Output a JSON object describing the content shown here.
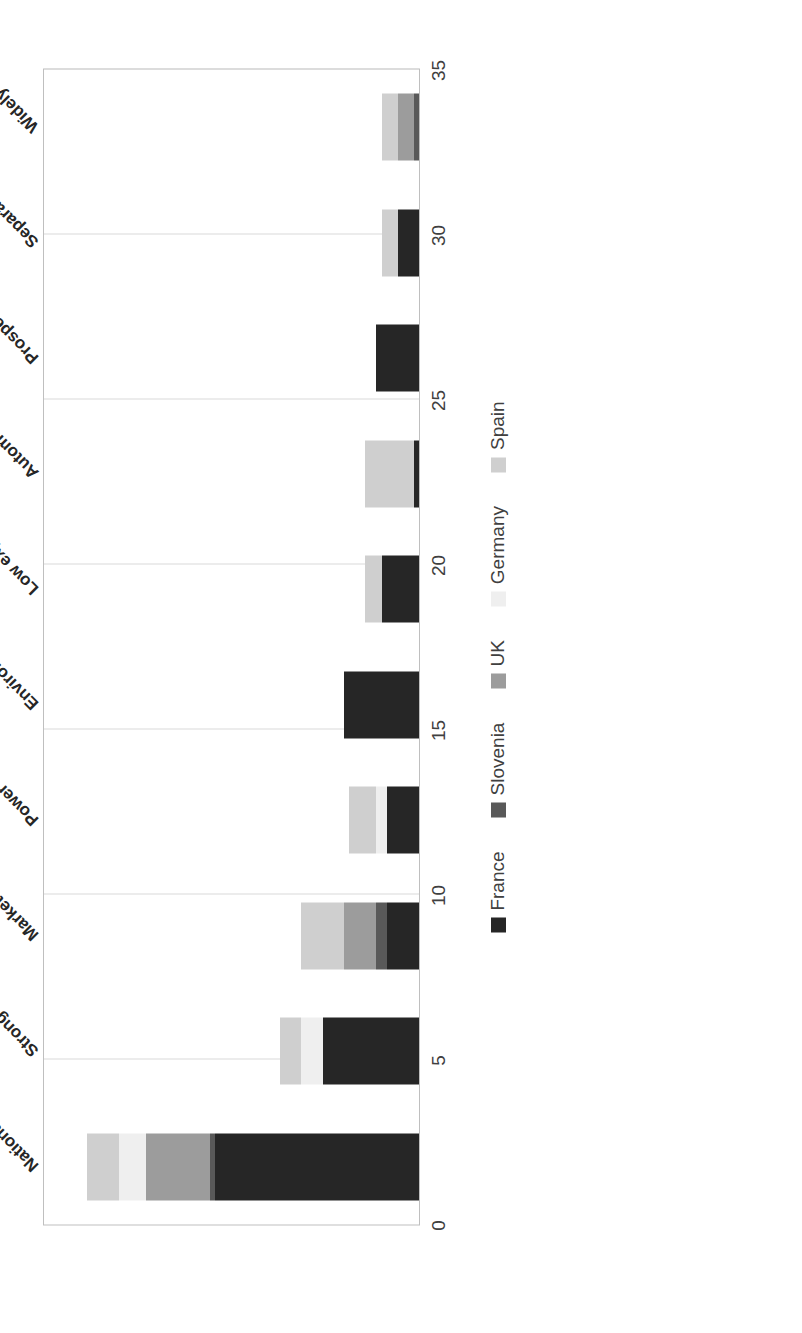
{
  "chart_data": {
    "type": "bar",
    "title": "",
    "subtitle": "",
    "xlabel": "",
    "ylabel": "",
    "orientation": "vertical-stacked",
    "stacked": true,
    "grid": true,
    "legend_position": "bottom",
    "ylim": [
      0,
      35
    ],
    "yticks": [
      0,
      5,
      10,
      15,
      20,
      25,
      30,
      35
    ],
    "ytick_labels": [
      "0",
      "5",
      "10",
      "15",
      "20",
      "25",
      "30",
      "35"
    ],
    "categories": [
      "National differences and specificities",
      "Strong potential but uncertain future",
      "Market development in near term",
      "Power to gas",
      "Environmental goals will drive H2 use",
      "Low expectations in short term",
      "Automobile use critical to FC future",
      "Prospects for stationary and mobile are related",
      "Separate coexistence with batteries",
      "Widely prevalent in long term"
    ],
    "series": [
      {
        "name": "France",
        "color": "#262626",
        "values": [
          19,
          9,
          3,
          3,
          7,
          3.5,
          0.5,
          4,
          2,
          0
        ]
      },
      {
        "name": "Slovenia",
        "color": "#595959",
        "values": [
          0.5,
          0,
          1,
          0,
          0,
          0,
          0,
          0,
          0,
          0.5
        ]
      },
      {
        "name": "UK",
        "color": "#9c9c9c",
        "values": [
          6,
          0,
          3,
          0,
          0,
          0,
          0,
          0,
          0,
          1.5
        ]
      },
      {
        "name": "Germany",
        "color": "#efefef",
        "values": [
          2.5,
          2,
          0,
          1,
          0,
          0,
          0,
          0,
          0,
          0
        ]
      },
      {
        "name": "Spain",
        "color": "#cfcfcf",
        "values": [
          3,
          2,
          4,
          2.5,
          0,
          1.5,
          4.5,
          0,
          1.5,
          1.5
        ]
      }
    ],
    "totals": [
      31,
      13,
      11,
      6.5,
      7,
      5,
      5,
      4,
      3.5,
      3.5
    ],
    "legend_entries": [
      "France",
      "Slovenia",
      "UK",
      "Germany",
      "Spain"
    ]
  },
  "axis": {
    "value_ticks": [
      "0",
      "5",
      "10",
      "15",
      "20",
      "25",
      "30",
      "35"
    ]
  }
}
